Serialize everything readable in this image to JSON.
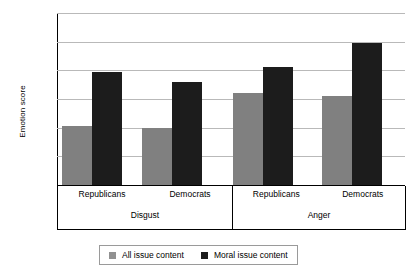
{
  "chart_data": {
    "type": "bar",
    "title": "",
    "xlabel": "",
    "ylabel": "Emotion score",
    "ylim": [
      0,
      3
    ],
    "ytick_labels": [
      "0",
      "0.5",
      "1",
      "1.5",
      "2",
      "2.5",
      "3"
    ],
    "ytick_values": [
      0,
      0.5,
      1,
      1.5,
      2,
      2.5,
      3
    ],
    "grid": true,
    "legend_position": "bottom",
    "group_labels": [
      "Disgust",
      "Anger"
    ],
    "categories": [
      "Republicans",
      "Democrats",
      "Republicans",
      "Democrats"
    ],
    "groups": [
      {
        "name": "Disgust",
        "categories": [
          "Republicans",
          "Democrats"
        ]
      },
      {
        "name": "Anger",
        "categories": [
          "Republicans",
          "Democrats"
        ]
      }
    ],
    "series": [
      {
        "name": "All issue content",
        "color": "#808080",
        "values": [
          1.03,
          1.0,
          1.6,
          1.55
        ]
      },
      {
        "name": "Moral issue content",
        "color": "#1c1c1c",
        "values": [
          1.97,
          1.8,
          2.05,
          2.48
        ]
      }
    ]
  },
  "legend": {
    "items": [
      {
        "label": "All issue content",
        "swatch": "all"
      },
      {
        "label": "Moral issue content",
        "swatch": "moral"
      }
    ]
  }
}
